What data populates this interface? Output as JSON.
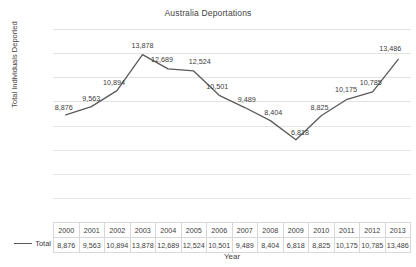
{
  "chart_data": {
    "type": "line",
    "title": "Australia Deportations",
    "xlabel": "Year",
    "ylabel": "Total Individuals Deported",
    "categories": [
      "2000",
      "2001",
      "2002",
      "2003",
      "2004",
      "2005",
      "2006",
      "2007",
      "2008",
      "2009",
      "2010",
      "2011",
      "2012",
      "2013"
    ],
    "values": [
      8876,
      9563,
      10894,
      13878,
      12689,
      12524,
      10501,
      9489,
      8404,
      6818,
      8825,
      10175,
      10785,
      13486
    ],
    "value_labels": [
      "8,876",
      "9,563",
      "10,894",
      "13,878",
      "12,689",
      "12,524",
      "10,501",
      "9,489",
      "8,404",
      "6,818",
      "8,825",
      "10,175",
      "10,785",
      "13,486"
    ],
    "series": [
      {
        "name": "Total",
        "values": [
          8876,
          9563,
          10894,
          13878,
          12689,
          12524,
          10501,
          9489,
          8404,
          6818,
          8825,
          10175,
          10785,
          13486
        ]
      }
    ],
    "ylim": [
      0,
      16000
    ],
    "ytick_labels": [
      "16,000",
      "14,000",
      "12,000",
      "10,000",
      "8,000",
      "6,000",
      "4,000",
      "2,000",
      "0"
    ],
    "ytick_values": [
      16000,
      14000,
      12000,
      10000,
      8000,
      6000,
      4000,
      2000,
      0
    ],
    "grid": true,
    "legend_position": "table-left",
    "line_color": "#5a5a5a",
    "grid_color": "#e3e3e3"
  },
  "table": {
    "header_row": [
      "2000",
      "2001",
      "2002",
      "2003",
      "2004",
      "2005",
      "2006",
      "2007",
      "2008",
      "2009",
      "2010",
      "2011",
      "2012",
      "2013"
    ],
    "series_label": "Total",
    "data_row": [
      "8,876",
      "9,563",
      "10,894",
      "13,878",
      "12,689",
      "12,524",
      "10,501",
      "9,489",
      "8,404",
      "6,818",
      "8,825",
      "10,175",
      "10,785",
      "13,486"
    ]
  }
}
